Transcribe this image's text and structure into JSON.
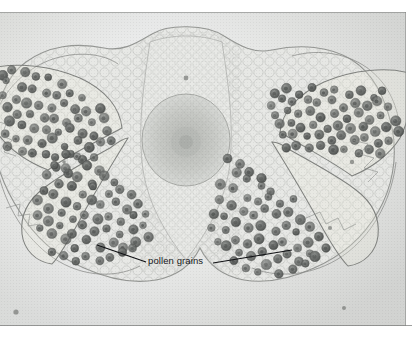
{
  "figure": {
    "kind": "light-micrograph",
    "plate_background_color": "#e9eae7",
    "border_color": "#7a7c7a",
    "page_background_color": "#ffffff"
  },
  "annotations": {
    "pollen_label": "pollen grains",
    "label_color": "#17181a",
    "leader_line_color": "#101114",
    "leader_lines": [
      {
        "name": "left-leader",
        "x1": 97,
        "y1": 245,
        "x2": 146,
        "y2": 262
      },
      {
        "name": "right-leader",
        "x1": 213,
        "y1": 263,
        "x2": 292,
        "y2": 250
      }
    ]
  },
  "specimen": {
    "tissue_fill_color": "#e4e5e2",
    "tissue_outline_color": "#9a9c99",
    "epidermis_outline_color": "#8d8f8c",
    "pollen_grain_color": "#6f7270",
    "pollen_grain_core_color": "#4c4f4d",
    "vascular_bundle_color": "#c8cac6",
    "vascular_bundle": {
      "cx": 186,
      "cy": 128,
      "rx": 44,
      "ry": 46
    },
    "locules": [
      {
        "name": "upper-left-pollen-sac",
        "grain_count": 58
      },
      {
        "name": "upper-right-pollen-sac",
        "grain_count": 62
      },
      {
        "name": "lower-left-pollen-sac",
        "grain_count": 64
      },
      {
        "name": "lower-right-pollen-sac",
        "grain_count": 60
      }
    ]
  },
  "chart_data": {
    "type": "scatter",
    "xlabel": "",
    "ylabel": "",
    "xlim": [
      0,
      406
    ],
    "ylim": [
      0,
      314
    ],
    "grid": false,
    "legend": "none",
    "annotations": [
      "pollen grains"
    ],
    "series": [
      {
        "name": "upper-left-pollen-sac",
        "marker": "circle",
        "color": "#6f7270",
        "points": [
          [
            2,
            62
          ],
          [
            13,
            57
          ],
          [
            25,
            59
          ],
          [
            38,
            63
          ],
          [
            50,
            66
          ],
          [
            61,
            72
          ],
          [
            8,
            70
          ],
          [
            20,
            74
          ],
          [
            33,
            77
          ],
          [
            45,
            80
          ],
          [
            57,
            83
          ],
          [
            70,
            80
          ],
          [
            82,
            84
          ],
          [
            3,
            82
          ],
          [
            15,
            88
          ],
          [
            28,
            90
          ],
          [
            40,
            93
          ],
          [
            52,
            95
          ],
          [
            64,
            92
          ],
          [
            76,
            96
          ],
          [
            88,
            99
          ],
          [
            99,
            95
          ],
          [
            7,
            97
          ],
          [
            19,
            101
          ],
          [
            31,
            104
          ],
          [
            43,
            106
          ],
          [
            55,
            108
          ],
          [
            67,
            110
          ],
          [
            79,
            107
          ],
          [
            91,
            111
          ],
          [
            103,
            108
          ],
          [
            11,
            110
          ],
          [
            23,
            114
          ],
          [
            35,
            117
          ],
          [
            47,
            119
          ],
          [
            59,
            121
          ],
          [
            71,
            118
          ],
          [
            83,
            122
          ],
          [
            95,
            124
          ],
          [
            107,
            120
          ],
          [
            5,
            122
          ],
          [
            17,
            126
          ],
          [
            29,
            129
          ],
          [
            41,
            131
          ],
          [
            53,
            128
          ],
          [
            65,
            133
          ],
          [
            77,
            130
          ],
          [
            89,
            134
          ],
          [
            101,
            131
          ],
          [
            113,
            127
          ],
          [
            9,
            136
          ],
          [
            21,
            140
          ],
          [
            33,
            143
          ],
          [
            45,
            141
          ],
          [
            57,
            145
          ],
          [
            69,
            142
          ],
          [
            81,
            147
          ],
          [
            93,
            144
          ],
          [
            58,
            156
          ],
          [
            70,
            160
          ]
        ]
      },
      {
        "name": "upper-right-pollen-sac",
        "marker": "circle",
        "color": "#6f7270",
        "points": [
          [
            276,
            82
          ],
          [
            288,
            78
          ],
          [
            300,
            81
          ],
          [
            312,
            76
          ],
          [
            324,
            80
          ],
          [
            336,
            77
          ],
          [
            348,
            82
          ],
          [
            360,
            79
          ],
          [
            372,
            84
          ],
          [
            384,
            80
          ],
          [
            270,
            92
          ],
          [
            282,
            88
          ],
          [
            294,
            91
          ],
          [
            306,
            87
          ],
          [
            318,
            92
          ],
          [
            330,
            89
          ],
          [
            342,
            94
          ],
          [
            354,
            90
          ],
          [
            366,
            95
          ],
          [
            378,
            91
          ],
          [
            390,
            96
          ],
          [
            274,
            102
          ],
          [
            286,
            99
          ],
          [
            298,
            103
          ],
          [
            310,
            100
          ],
          [
            322,
            104
          ],
          [
            334,
            101
          ],
          [
            346,
            106
          ],
          [
            358,
            102
          ],
          [
            370,
            107
          ],
          [
            382,
            103
          ],
          [
            394,
            108
          ],
          [
            278,
            113
          ],
          [
            290,
            110
          ],
          [
            302,
            114
          ],
          [
            314,
            111
          ],
          [
            326,
            116
          ],
          [
            338,
            113
          ],
          [
            350,
            118
          ],
          [
            362,
            114
          ],
          [
            374,
            119
          ],
          [
            386,
            115
          ],
          [
            398,
            120
          ],
          [
            282,
            124
          ],
          [
            294,
            121
          ],
          [
            306,
            126
          ],
          [
            318,
            122
          ],
          [
            330,
            127
          ],
          [
            342,
            124
          ],
          [
            354,
            129
          ],
          [
            366,
            125
          ],
          [
            378,
            130
          ],
          [
            390,
            127
          ],
          [
            286,
            135
          ],
          [
            298,
            132
          ],
          [
            310,
            137
          ],
          [
            322,
            134
          ],
          [
            334,
            139
          ],
          [
            346,
            136
          ],
          [
            358,
            141
          ],
          [
            370,
            138
          ],
          [
            382,
            143
          ]
        ]
      },
      {
        "name": "lower-left-pollen-sac",
        "marker": "circle",
        "color": "#6f7270",
        "points": [
          [
            64,
            140
          ],
          [
            76,
            146
          ],
          [
            88,
            152
          ],
          [
            100,
            158
          ],
          [
            55,
            152
          ],
          [
            67,
            158
          ],
          [
            79,
            164
          ],
          [
            91,
            170
          ],
          [
            103,
            163
          ],
          [
            115,
            169
          ],
          [
            47,
            164
          ],
          [
            59,
            170
          ],
          [
            71,
            176
          ],
          [
            83,
            182
          ],
          [
            95,
            176
          ],
          [
            107,
            182
          ],
          [
            119,
            178
          ],
          [
            131,
            184
          ],
          [
            42,
            177
          ],
          [
            54,
            183
          ],
          [
            66,
            189
          ],
          [
            78,
            195
          ],
          [
            90,
            188
          ],
          [
            102,
            194
          ],
          [
            114,
            190
          ],
          [
            126,
            196
          ],
          [
            138,
            192
          ],
          [
            38,
            190
          ],
          [
            50,
            196
          ],
          [
            62,
            202
          ],
          [
            74,
            208
          ],
          [
            86,
            201
          ],
          [
            98,
            207
          ],
          [
            110,
            203
          ],
          [
            122,
            209
          ],
          [
            134,
            205
          ],
          [
            146,
            200
          ],
          [
            36,
            203
          ],
          [
            48,
            209
          ],
          [
            60,
            215
          ],
          [
            72,
            221
          ],
          [
            84,
            214
          ],
          [
            96,
            220
          ],
          [
            108,
            216
          ],
          [
            120,
            222
          ],
          [
            132,
            218
          ],
          [
            144,
            213
          ],
          [
            40,
            217
          ],
          [
            52,
            223
          ],
          [
            64,
            229
          ],
          [
            76,
            235
          ],
          [
            88,
            228
          ],
          [
            100,
            234
          ],
          [
            112,
            230
          ],
          [
            124,
            236
          ],
          [
            136,
            231
          ],
          [
            148,
            226
          ],
          [
            50,
            238
          ],
          [
            62,
            244
          ],
          [
            74,
            250
          ],
          [
            86,
            243
          ],
          [
            98,
            249
          ],
          [
            110,
            245
          ],
          [
            122,
            240
          ],
          [
            134,
            235
          ]
        ]
      },
      {
        "name": "lower-right-pollen-sac",
        "marker": "circle",
        "color": "#6f7270",
        "points": [
          [
            226,
            148
          ],
          [
            238,
            154
          ],
          [
            250,
            160
          ],
          [
            262,
            166
          ],
          [
            236,
            160
          ],
          [
            248,
            166
          ],
          [
            260,
            172
          ],
          [
            272,
            178
          ],
          [
            222,
            172
          ],
          [
            234,
            178
          ],
          [
            246,
            184
          ],
          [
            258,
            190
          ],
          [
            270,
            184
          ],
          [
            282,
            190
          ],
          [
            294,
            186
          ],
          [
            218,
            186
          ],
          [
            230,
            192
          ],
          [
            242,
            198
          ],
          [
            254,
            204
          ],
          [
            266,
            198
          ],
          [
            278,
            204
          ],
          [
            290,
            200
          ],
          [
            302,
            206
          ],
          [
            214,
            200
          ],
          [
            226,
            206
          ],
          [
            238,
            212
          ],
          [
            250,
            218
          ],
          [
            262,
            212
          ],
          [
            274,
            218
          ],
          [
            286,
            214
          ],
          [
            298,
            220
          ],
          [
            310,
            216
          ],
          [
            212,
            214
          ],
          [
            224,
            220
          ],
          [
            236,
            226
          ],
          [
            248,
            232
          ],
          [
            260,
            226
          ],
          [
            272,
            232
          ],
          [
            284,
            228
          ],
          [
            296,
            234
          ],
          [
            308,
            230
          ],
          [
            320,
            225
          ],
          [
            216,
            228
          ],
          [
            228,
            234
          ],
          [
            240,
            240
          ],
          [
            252,
            246
          ],
          [
            264,
            240
          ],
          [
            276,
            246
          ],
          [
            288,
            242
          ],
          [
            300,
            248
          ],
          [
            312,
            243
          ],
          [
            324,
            238
          ],
          [
            232,
            249
          ],
          [
            244,
            255
          ],
          [
            256,
            261
          ],
          [
            268,
            254
          ],
          [
            280,
            260
          ],
          [
            292,
            256
          ],
          [
            304,
            251
          ],
          [
            316,
            246
          ]
        ]
      }
    ]
  }
}
